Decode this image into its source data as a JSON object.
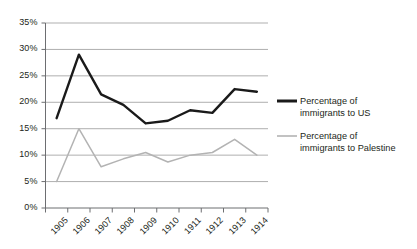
{
  "chart_data": {
    "type": "line",
    "title": "",
    "xlabel": "",
    "ylabel": "",
    "categories": [
      "1905",
      "1906",
      "1907",
      "1908",
      "1909",
      "1910",
      "1911",
      "1912",
      "1913",
      "1914"
    ],
    "ylim": [
      0,
      35
    ],
    "ytick_labels": [
      "0%",
      "5%",
      "10%",
      "15%",
      "20%",
      "25%",
      "30%",
      "35%"
    ],
    "ytick_values": [
      0,
      5,
      10,
      15,
      20,
      25,
      30,
      35
    ],
    "grid": "horizontal",
    "legend_position": "right",
    "series": [
      {
        "name": "Percentage of immigrants to US",
        "color": "#1a1a1a",
        "values": [
          17.0,
          29.0,
          21.5,
          19.5,
          16.0,
          16.5,
          18.5,
          18.0,
          22.5,
          22.0
        ]
      },
      {
        "name": "Percentage of immigrants to Palestine",
        "color": "#b3b3b3",
        "values": [
          5.0,
          15.0,
          7.8,
          9.3,
          10.5,
          8.7,
          10.0,
          10.5,
          13.0,
          10.0
        ]
      }
    ]
  },
  "legend": {
    "entries": [
      {
        "line1": "Percentage of",
        "line2": "immigrants to US"
      },
      {
        "line1": "Percentage of",
        "line2": "immigrants to Palestine"
      }
    ]
  },
  "colors": {
    "series_us": "#1a1a1a",
    "series_palestine": "#b3b3b3",
    "grid": "#a6a6a6",
    "axis": "#6d6e71",
    "text": "#231f20",
    "background": "#ffffff"
  }
}
